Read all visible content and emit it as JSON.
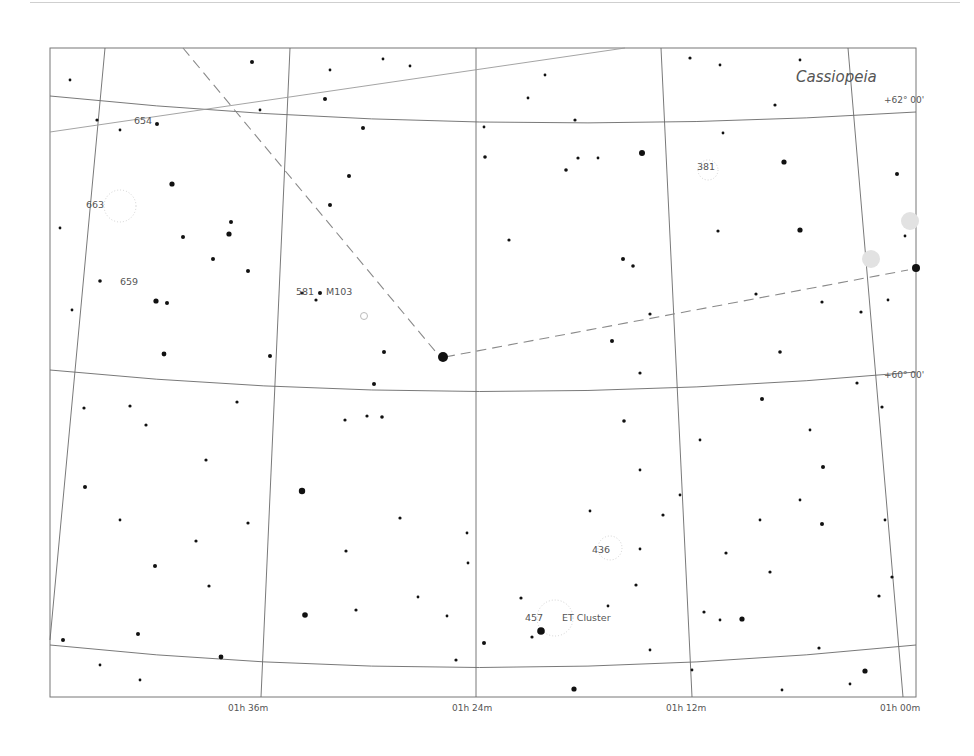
{
  "chart": {
    "constellation_label": "Cassiopeia",
    "frame": {
      "x": 50,
      "y": 48,
      "w": 866,
      "h": 649
    },
    "dec_labels": [
      {
        "text": "+62° 00'",
        "x": 884,
        "y": 103
      },
      {
        "text": "+60° 00'",
        "x": 884,
        "y": 378
      }
    ],
    "ra_labels": [
      {
        "text": "01h 36m",
        "x": 228,
        "y": 711
      },
      {
        "text": "01h 24m",
        "x": 452,
        "y": 711
      },
      {
        "text": "01h 12m",
        "x": 666,
        "y": 711
      },
      {
        "text": "01h 00m",
        "x": 880,
        "y": 711
      }
    ],
    "objects": [
      {
        "text": "654",
        "x": 134,
        "y": 124
      },
      {
        "text": "663",
        "x": 86,
        "y": 208
      },
      {
        "text": "659",
        "x": 120,
        "y": 285
      },
      {
        "text": "581",
        "x": 296,
        "y": 295
      },
      {
        "text": "M103",
        "x": 326,
        "y": 295
      },
      {
        "text": "381",
        "x": 697,
        "y": 170
      },
      {
        "text": "436",
        "x": 592,
        "y": 553
      },
      {
        "text": "457",
        "x": 525,
        "y": 621
      },
      {
        "text": "ET Cluster",
        "x": 562,
        "y": 621
      }
    ],
    "colors": {
      "grid": "#6a6a6a",
      "star": "#111111",
      "label": "#555555",
      "constellation_line": "#8a8a8a",
      "ecliptic": "#9a9a9a"
    }
  }
}
